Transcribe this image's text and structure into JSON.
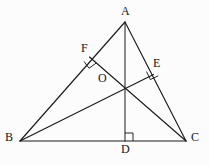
{
  "figure": {
    "background_color": "#fcfcfc",
    "line_color": "#1b1b1b",
    "labels": {
      "a": "A",
      "b": "B",
      "c": "C",
      "d": "D",
      "e": "E",
      "f": "F",
      "o": "O"
    },
    "label_positions": {
      "a": {
        "x": 121,
        "y": 7
      },
      "b": {
        "x": 5,
        "y": 133
      },
      "c": {
        "x": 191,
        "y": 133
      },
      "d": {
        "x": 121,
        "y": 145
      },
      "e": {
        "x": 153,
        "y": 59
      },
      "f": {
        "x": 81,
        "y": 44
      },
      "o": {
        "x": 98,
        "y": 73
      }
    },
    "points": {
      "A": {
        "x": 125,
        "y": 22
      },
      "B": {
        "x": 20,
        "y": 141
      },
      "C": {
        "x": 186,
        "y": 141
      },
      "D": {
        "x": 125,
        "y": 141
      },
      "E": {
        "x": 153.5,
        "y": 74.5
      },
      "F": {
        "x": 89.5,
        "y": 57
      },
      "O": {
        "x": 125,
        "y": 85
      }
    },
    "segments": [
      {
        "name": "side-ab",
        "from": "A",
        "to": "B"
      },
      {
        "name": "side-ac",
        "from": "A",
        "to": "C"
      },
      {
        "name": "side-bc",
        "from": "B",
        "to": "C"
      },
      {
        "name": "altitude-ad",
        "from": "A",
        "to": "D"
      },
      {
        "name": "altitude-be",
        "from": "B",
        "to": "E"
      },
      {
        "name": "altitude-cf",
        "from": "C",
        "to": "F"
      }
    ],
    "right_angle_markers": [
      {
        "name": "right-angle-at-d",
        "at": "D",
        "note": "AD perpendicular to BC"
      },
      {
        "name": "right-angle-at-e",
        "at": "E",
        "note": "BE perpendicular to AC"
      },
      {
        "name": "right-angle-at-f",
        "at": "F",
        "note": "CF perpendicular to AB"
      }
    ]
  }
}
